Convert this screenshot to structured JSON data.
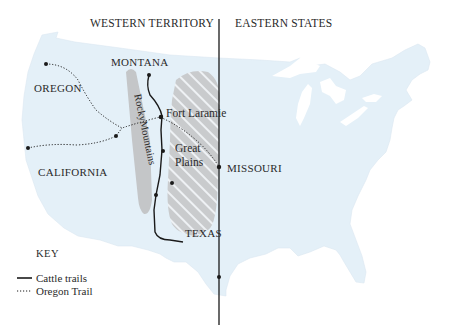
{
  "map": {
    "headers": {
      "west": "WESTERN TERRITORY",
      "east": "EASTERN STATES"
    },
    "labels": {
      "oregon": "OREGON",
      "montana": "MONTANA",
      "california": "CALIFORNIA",
      "missouri": "MISSOURI",
      "texas": "TEXAS",
      "fort_laramie": "Fort Laramie",
      "great_plains_line1": "Great",
      "great_plains_line2": "Plains",
      "rocky_mountains": "RockyMountains"
    },
    "key": {
      "title": "KEY",
      "items": [
        {
          "symbol": "solid-line",
          "label": "Cattle trails"
        },
        {
          "symbol": "dotted-line",
          "label": "Oregon Trail"
        }
      ]
    },
    "colors": {
      "land": "#e4f0f8",
      "water": "#ffffff",
      "mountains": "#c4c6c8",
      "plains": "#c9cbcd",
      "hatch": "#f2f4f6",
      "lines": "#1a1a1a",
      "text": "#2a2a2a"
    }
  }
}
